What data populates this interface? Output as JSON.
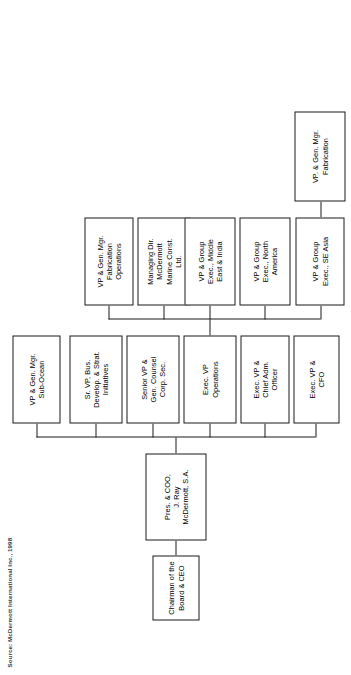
{
  "chart": {
    "source_note": "Source: McDermott International Inc., 1998",
    "type": "org-chart",
    "orientation": "rotated-90-ccw",
    "line_color": "#1a1a1a",
    "box_fill": "#ffffff",
    "nodes": {
      "chairman": {
        "label": "Chairman of the\nBoard & CEO",
        "level": 1
      },
      "president": {
        "label": "Pres. & COO,\nJ. Ray\nMcDermott, S.A.",
        "level": 2
      },
      "cfo": {
        "label": "Exec. VP &\nCFO",
        "level": 3
      },
      "admin": {
        "label": "Exec. VP &\nChief Adm.\nOfficer",
        "level": 3
      },
      "operations": {
        "label": "Exec. VP\nOperations",
        "level": 3
      },
      "counsel": {
        "label": "Senior VP &\nGen. Counsel\nCorp. Sec.",
        "level": 3
      },
      "bizdev": {
        "label": "Sr. VP, Bus.\nDevelop. & Strat.\nInitiatives",
        "level": 3
      },
      "subocean": {
        "label": "VP & Gen. Mgr.\nSub-Ocean",
        "level": 3
      },
      "seasia": {
        "label": "VP & Group\nExec., SE Asia",
        "level": 4
      },
      "northamerica": {
        "label": "VP & Group\nExec., North\nAmerica",
        "level": 4
      },
      "middleeast": {
        "label": "VP & Group\nExec., Middle\nEast & India",
        "level": 4
      },
      "marineconst": {
        "label": "Managing Dir.\nMcDermott\nMarine Const.\nLtd.",
        "level": 4
      },
      "fabops": {
        "label": "VP & Gen. Mgr.\nFabrication\nOperations",
        "level": 4
      },
      "fabrication": {
        "label": "VP. & Gen. Mgr.\nFabrication",
        "level": 5
      }
    },
    "edges": [
      {
        "from": "chairman",
        "to": "president"
      },
      {
        "from": "president",
        "to": "cfo"
      },
      {
        "from": "president",
        "to": "admin"
      },
      {
        "from": "president",
        "to": "operations"
      },
      {
        "from": "president",
        "to": "counsel"
      },
      {
        "from": "president",
        "to": "bizdev"
      },
      {
        "from": "president",
        "to": "subocean"
      },
      {
        "from": "operations",
        "to": "seasia"
      },
      {
        "from": "operations",
        "to": "northamerica"
      },
      {
        "from": "operations",
        "to": "middleeast"
      },
      {
        "from": "operations",
        "to": "marineconst"
      },
      {
        "from": "operations",
        "to": "fabops"
      },
      {
        "from": "seasia",
        "to": "fabrication"
      }
    ]
  }
}
